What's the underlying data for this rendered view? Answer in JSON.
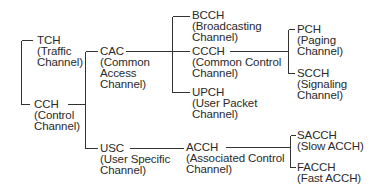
{
  "diagram": {
    "type": "tree",
    "title": "",
    "nodes": [
      {
        "id": "tch",
        "abbr": "TCH",
        "line1": "(Traffic",
        "line2": "Channel)"
      },
      {
        "id": "cch",
        "abbr": "CCH",
        "line1": "(Control",
        "line2": "Channel)"
      },
      {
        "id": "cac",
        "abbr": "CAC",
        "line1": "(Common",
        "line2": "Access",
        "line3": "Channel)"
      },
      {
        "id": "usc",
        "abbr": "USC",
        "line1": "(User Specific",
        "line2": "Channel)"
      },
      {
        "id": "bcch",
        "abbr": "BCCH",
        "line1": "(Broadcasting",
        "line2": "Channel)"
      },
      {
        "id": "ccch",
        "abbr": "CCCH",
        "line1": "(Common Control",
        "line2": "Channel)"
      },
      {
        "id": "upch",
        "abbr": "UPCH",
        "line1": "(User Packet",
        "line2": "Channel)"
      },
      {
        "id": "pch",
        "abbr": "PCH",
        "line1": "(Paging",
        "line2": "Channel)"
      },
      {
        "id": "scch",
        "abbr": "SCCH",
        "line1": "(Signaling",
        "line2": "Channel)"
      },
      {
        "id": "acch",
        "abbr": "ACCH",
        "line1": "(Associated Control",
        "line2": "Channel)"
      },
      {
        "id": "sacch",
        "abbr": "SACCH",
        "line1": "(Slow ACCH)"
      },
      {
        "id": "facch",
        "abbr": "FACCH",
        "line1": "(Fast ACCH)"
      }
    ],
    "edges": [
      [
        "root",
        "tch"
      ],
      [
        "root",
        "cch"
      ],
      [
        "cch",
        "cac"
      ],
      [
        "cch",
        "usc"
      ],
      [
        "cac",
        "bcch"
      ],
      [
        "cac",
        "ccch"
      ],
      [
        "cac",
        "upch"
      ],
      [
        "ccch",
        "pch"
      ],
      [
        "ccch",
        "scch"
      ],
      [
        "usc",
        "acch"
      ],
      [
        "acch",
        "sacch"
      ],
      [
        "acch",
        "facch"
      ]
    ],
    "line_color": "#333333",
    "text_color": "#2a2a2a"
  }
}
